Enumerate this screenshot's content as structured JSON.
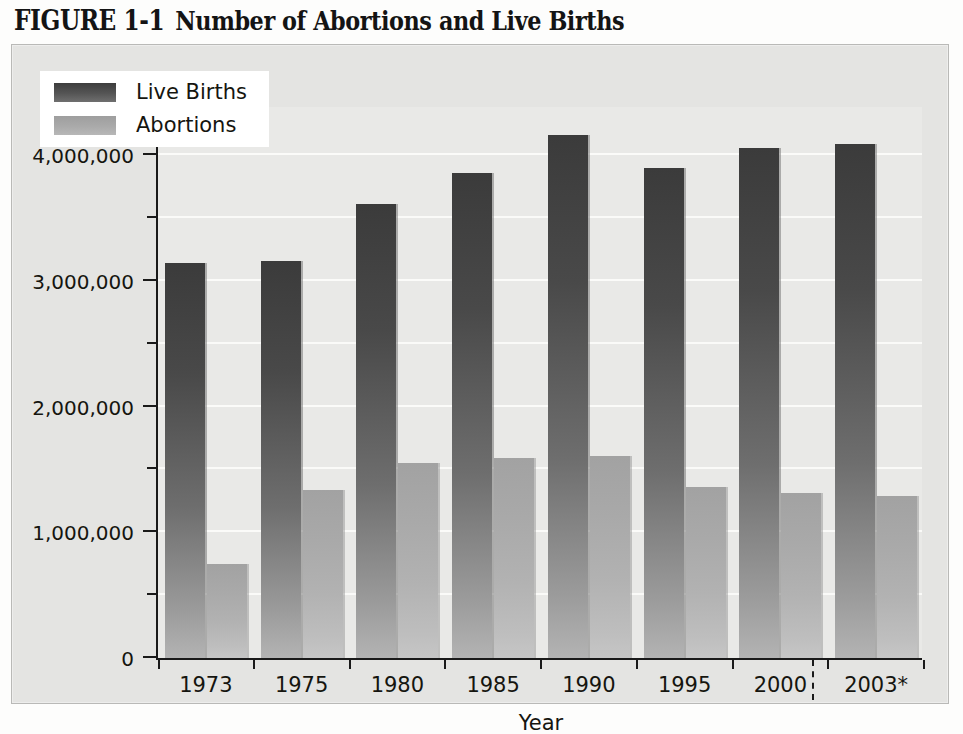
{
  "figure": {
    "number": "FIGURE 1-1",
    "caption": "Number of Abortions and Live Births"
  },
  "chart_data": {
    "type": "bar",
    "title": "Number of Abortions and Live Births",
    "xlabel": "Year",
    "ylabel": "",
    "categories": [
      "1973",
      "1975",
      "1980",
      "1985",
      "1990",
      "1995",
      "2000",
      "2003*"
    ],
    "series": [
      {
        "name": "Live Births",
        "color": "#3b3b3b",
        "values": [
          3140000,
          3160000,
          3610000,
          3860000,
          4160000,
          3900000,
          4060000,
          4090000
        ]
      },
      {
        "name": "Abortions",
        "color": "#a8a8a8",
        "values": [
          745000,
          1340000,
          1550000,
          1590000,
          1610000,
          1360000,
          1310000,
          1290000
        ]
      }
    ],
    "ylim": [
      0,
      4400000
    ],
    "yticks": [
      0,
      1000000,
      2000000,
      3000000,
      4000000
    ],
    "ytick_labels": [
      "0",
      "1,000,000",
      "2,000,000",
      "3,000,000",
      "4,000,000"
    ],
    "yminor_step": 500000,
    "grid": true,
    "legend_position": "top-left",
    "annotations": [
      "dashed vertical separator between 2000 and 2003*"
    ]
  },
  "legend": {
    "items": [
      {
        "label": "Live Births",
        "swatch": "live"
      },
      {
        "label": "Abortions",
        "swatch": "abortion"
      }
    ]
  },
  "axes": {
    "x_title": "Year",
    "y_tick_labels": [
      "4,000,000",
      "3,000,000",
      "2,000,000",
      "1,000,000",
      "0"
    ],
    "x_tick_labels": [
      "1973",
      "1975",
      "1980",
      "1985",
      "1990",
      "1995",
      "2000",
      "2003*"
    ]
  },
  "colors": {
    "page_background": "#fdfdfc",
    "frame_background": "#e4e4e2",
    "plot_background": "#e9e9e7",
    "gridline": "#fbfbf9",
    "axis": "#1a1a1a",
    "live_births": "#3b3b3b",
    "abortions": "#a8a8a8",
    "text": "#15150f"
  }
}
